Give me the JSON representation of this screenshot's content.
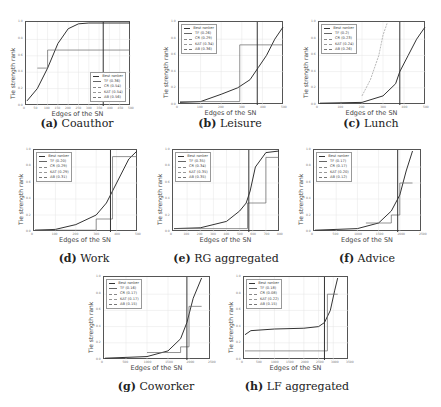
{
  "figure": {
    "y_axis_label": "Tie strength rank",
    "x_axis_label": "Edges of the SN"
  },
  "chart_data": [
    {
      "type": "line",
      "id": "a",
      "title": "(a) Coauthor",
      "caption_letter": "(a)",
      "caption_text": "Coauthor",
      "xlabel": "Edges of the SN",
      "ylabel": "Tie strength rank",
      "xlim": [
        0,
        500
      ],
      "ylim": [
        0,
        1.0
      ],
      "x_ticks": [
        "0",
        "50",
        "100",
        "150",
        "200",
        "250",
        "300",
        "350",
        "400",
        "450",
        "500"
      ],
      "y_ticks": [
        "0.0",
        "0.2",
        "0.4",
        "0.6",
        "0.8",
        "1.0"
      ],
      "legend_position": "lower right",
      "legend": [
        "Best ranker",
        "TF (0.36)",
        "CR (0.54)",
        "KAT (0.54)",
        "AB (0.56)"
      ],
      "vertical_marker_x": 370,
      "series": [
        {
          "name": "Best ranker",
          "x": [
            0,
            50,
            100,
            150,
            200,
            250,
            300,
            500
          ],
          "y": [
            0.05,
            0.2,
            0.45,
            0.75,
            0.93,
            0.99,
            1.0,
            1.0
          ]
        },
        {
          "name": "TF",
          "x": [
            50,
            100,
            100,
            500
          ],
          "y": [
            0.45,
            0.45,
            0.67,
            0.67
          ]
        }
      ]
    },
    {
      "type": "line",
      "id": "b",
      "title": "(b) Leisure",
      "caption_letter": "(b)",
      "caption_text": "Leisure",
      "xlabel": "Edges of the SN",
      "ylabel": "Tie strength rank",
      "xlim": [
        0,
        500
      ],
      "ylim": [
        0,
        1.0
      ],
      "x_ticks": [
        "0",
        "100",
        "200",
        "300",
        "400",
        "500"
      ],
      "y_ticks": [
        "0.0",
        "0.2",
        "0.4",
        "0.6",
        "0.8",
        "1.0"
      ],
      "legend_position": "upper left",
      "legend": [
        "Best ranker",
        "TF (0.26)",
        "CR (0.29)",
        "KAT (0.34)",
        "AB (0.36)"
      ],
      "vertical_marker_x": 375,
      "series": [
        {
          "name": "Best ranker",
          "x": [
            0,
            100,
            200,
            280,
            340,
            380,
            420,
            460,
            500
          ],
          "y": [
            0.02,
            0.03,
            0.12,
            0.2,
            0.3,
            0.45,
            0.6,
            0.8,
            0.95
          ]
        },
        {
          "name": "TF",
          "x": [
            0,
            290,
            290,
            500
          ],
          "y": [
            0.03,
            0.03,
            0.73,
            0.73
          ]
        }
      ]
    },
    {
      "type": "line",
      "id": "c",
      "title": "(c) Lunch",
      "caption_letter": "(c)",
      "caption_text": "Lunch",
      "xlabel": "Edges of the SN",
      "ylabel": "Tie strength rank",
      "xlim": [
        0,
        500
      ],
      "ylim": [
        0,
        1.0
      ],
      "x_ticks": [
        "0",
        "100",
        "200",
        "300",
        "400",
        "500"
      ],
      "y_ticks": [
        "0.0",
        "0.2",
        "0.4",
        "0.6",
        "0.8",
        "1.0"
      ],
      "legend_position": "upper left",
      "legend": [
        "Best ranker",
        "TF (0.2)",
        "CR (0.23)",
        "KAT (0.24)",
        "AB (0.26)"
      ],
      "vertical_marker_x": 380,
      "series": [
        {
          "name": "Best ranker",
          "x": [
            0,
            200,
            300,
            360,
            380,
            420,
            460,
            500
          ],
          "y": [
            0.01,
            0.02,
            0.1,
            0.25,
            0.4,
            0.6,
            0.8,
            0.95
          ]
        },
        {
          "name": "CR",
          "x": [
            200,
            240,
            280,
            300,
            320
          ],
          "y": [
            0.1,
            0.3,
            0.6,
            0.85,
            1.0
          ]
        }
      ]
    },
    {
      "type": "line",
      "id": "d",
      "title": "(d) Work",
      "caption_letter": "(d)",
      "caption_text": "Work",
      "xlabel": "Edges of the SN",
      "ylabel": "Tie strength rank",
      "xlim": [
        0,
        500
      ],
      "ylim": [
        0,
        1.0
      ],
      "x_ticks": [
        "0",
        "100",
        "200",
        "300",
        "400",
        "500"
      ],
      "y_ticks": [
        "0.0",
        "0.2",
        "0.4",
        "0.6",
        "0.8",
        "1.0"
      ],
      "legend_position": "upper left",
      "legend": [
        "Best ranker",
        "TF (0.20)",
        "CR (0.29)",
        "KAT (0.29)",
        "AB (0.31)"
      ],
      "vertical_marker_x": 370,
      "series": [
        {
          "name": "Best ranker",
          "x": [
            0,
            100,
            200,
            300,
            350,
            380,
            420,
            460,
            500
          ],
          "y": [
            0.01,
            0.02,
            0.08,
            0.2,
            0.35,
            0.5,
            0.7,
            0.9,
            1.0
          ]
        },
        {
          "name": "TF",
          "x": [
            0,
            300,
            300,
            380,
            380,
            500
          ],
          "y": [
            0.01,
            0.01,
            0.15,
            0.15,
            0.93,
            0.93
          ]
        }
      ]
    },
    {
      "type": "line",
      "id": "e",
      "title": "(e) RG aggregated",
      "caption_letter": "(e)",
      "caption_text": "RG aggregated",
      "xlabel": "Edges of the SN",
      "ylabel": "Tie strength rank",
      "xlim": [
        0,
        800
      ],
      "ylim": [
        0,
        1.0
      ],
      "x_ticks": [
        "0",
        "100",
        "200",
        "300",
        "400",
        "500",
        "600",
        "700",
        "800"
      ],
      "y_ticks": [
        "0.0",
        "0.2",
        "0.4",
        "0.6",
        "0.8",
        "1.0"
      ],
      "legend_position": "upper left",
      "legend": [
        "Best ranker",
        "TF (0.35)",
        "CR (0.34)",
        "KAT (0.35)",
        "AB (0.35)"
      ],
      "vertical_marker_x": 570,
      "series": [
        {
          "name": "Best ranker",
          "x": [
            0,
            200,
            400,
            500,
            550,
            580,
            620,
            700,
            800
          ],
          "y": [
            0.03,
            0.04,
            0.12,
            0.25,
            0.35,
            0.5,
            0.8,
            0.98,
            1.0
          ]
        },
        {
          "name": "TF",
          "x": [
            0,
            560,
            560,
            700,
            700,
            800
          ],
          "y": [
            0.03,
            0.03,
            0.35,
            0.35,
            0.92,
            0.92
          ]
        }
      ]
    },
    {
      "type": "line",
      "id": "f",
      "title": "(f) Advice",
      "caption_letter": "(f)",
      "caption_text": "Advice",
      "xlabel": "Edges of the SN",
      "ylabel": "Tie strength rank",
      "xlim": [
        0,
        2500
      ],
      "ylim": [
        0,
        1.0
      ],
      "x_ticks": [
        "0",
        "500",
        "1000",
        "1500",
        "2000",
        "2500"
      ],
      "y_ticks": [
        "0.0",
        "0.2",
        "0.4",
        "0.6",
        "0.8",
        "1.0"
      ],
      "legend_position": "upper left",
      "legend": [
        "Best ranker",
        "TF (0.17)",
        "CR (0.17)",
        "KAT (0.20)",
        "AB (0.12)"
      ],
      "vertical_marker_x": 1950,
      "series": [
        {
          "name": "Best ranker",
          "x": [
            0,
            1000,
            1500,
            1800,
            2000,
            2150,
            2300
          ],
          "y": [
            0.01,
            0.03,
            0.1,
            0.25,
            0.45,
            0.75,
            1.0
          ]
        },
        {
          "name": "TF",
          "x": [
            1200,
            1800,
            1800,
            2000,
            2000,
            2300
          ],
          "y": [
            0.1,
            0.1,
            0.2,
            0.2,
            0.6,
            0.6
          ]
        }
      ]
    },
    {
      "type": "line",
      "id": "g",
      "title": "(g) Coworker",
      "caption_letter": "(g)",
      "caption_text": "Coworker",
      "xlabel": "Edges of the SN",
      "ylabel": "Tie strength rank",
      "xlim": [
        0,
        2500
      ],
      "ylim": [
        0,
        1.0
      ],
      "x_ticks": [
        "0",
        "500",
        "1000",
        "1500",
        "2000",
        "2500"
      ],
      "y_ticks": [
        "0.0",
        "0.2",
        "0.4",
        "0.6",
        "0.8",
        "1.0"
      ],
      "legend_position": "upper left",
      "legend": [
        "Best ranker",
        "TF (0.16)",
        "CR (0.17)",
        "KAT (0.17)",
        "AB (0.15)"
      ],
      "vertical_marker_x": 1950,
      "series": [
        {
          "name": "Best ranker",
          "x": [
            0,
            1000,
            1500,
            1800,
            1950,
            2100,
            2300
          ],
          "y": [
            0.01,
            0.03,
            0.1,
            0.25,
            0.45,
            0.75,
            1.0
          ]
        },
        {
          "name": "TF",
          "x": [
            1000,
            1800,
            1800,
            2000,
            2000,
            2300
          ],
          "y": [
            0.08,
            0.08,
            0.15,
            0.15,
            0.65,
            0.65
          ]
        }
      ]
    },
    {
      "type": "line",
      "id": "h",
      "title": "(h) LF aggregated",
      "caption_letter": "(h)",
      "caption_text": "LF aggregated",
      "xlabel": "Edges of the SN",
      "ylabel": "Tie strength rank",
      "xlim": [
        0,
        3500
      ],
      "ylim": [
        0,
        1.0
      ],
      "x_ticks": [
        "0",
        "500",
        "1000",
        "1500",
        "2000",
        "2500",
        "3000",
        "3500"
      ],
      "y_ticks": [
        "0.0",
        "0.2",
        "0.4",
        "0.6",
        "0.8",
        "1.0"
      ],
      "legend_position": "upper left",
      "legend": [
        "Best ranker",
        "TF (0.18)",
        "CR (0.08)",
        "KAT (0.22)",
        "AB (0.15)"
      ],
      "vertical_marker_x": 2700,
      "series": [
        {
          "name": "Best ranker",
          "x": [
            0,
            200,
            1000,
            2000,
            2500,
            2700,
            2900,
            3050,
            3150
          ],
          "y": [
            0.3,
            0.35,
            0.37,
            0.38,
            0.4,
            0.45,
            0.6,
            0.85,
            1.0
          ]
        },
        {
          "name": "TF",
          "x": [
            0,
            2800,
            2800,
            3150
          ],
          "y": [
            0.1,
            0.1,
            0.8,
            0.8
          ]
        }
      ]
    }
  ]
}
